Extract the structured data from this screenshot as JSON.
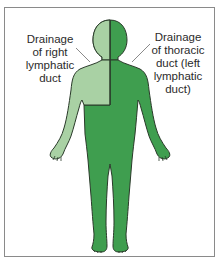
{
  "diagram": {
    "type": "lymphatic-drainage-body-map",
    "labels": {
      "right_lymphatic": "Drainage\nof right\nlymphatic\nduct",
      "thoracic": "Drainage\nof thoracic\nduct (left\nlymphatic\nduct)"
    },
    "colors": {
      "right_lymphatic_region": "#a9d1a4",
      "thoracic_region": "#3f9e4f",
      "outline": "#2a3a2a",
      "leader_line": "#8a8a8a",
      "frame": "#8a8a8a"
    }
  }
}
